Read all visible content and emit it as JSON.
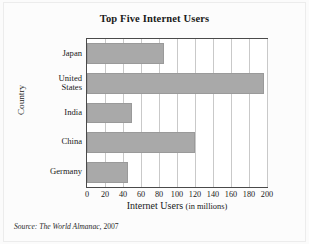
{
  "chart_data": {
    "type": "bar",
    "orientation": "horizontal",
    "title": "Top Five Internet Users",
    "xlabel": "Internet Users",
    "xlabel_units": "(in millions)",
    "ylabel": "Country",
    "categories": [
      "Japan",
      "United States",
      "India",
      "China",
      "Germany"
    ],
    "category_lines": [
      [
        "Japan"
      ],
      [
        "United",
        "States"
      ],
      [
        "India"
      ],
      [
        "China"
      ],
      [
        "Germany"
      ]
    ],
    "values": [
      86,
      197,
      50,
      120,
      46
    ],
    "xlim": [
      0,
      200
    ],
    "xticks": [
      0,
      20,
      40,
      60,
      80,
      100,
      120,
      140,
      160,
      180,
      200
    ],
    "xtick_labels": [
      "0",
      "20",
      "40",
      "60",
      "80",
      "100",
      "120",
      "140",
      "160",
      "180",
      "200"
    ],
    "grid": "vertical",
    "legend": "none",
    "bar_color": "#a9a9a9",
    "plot_background": "#ffffff",
    "gridline_color": "#c9c9c9",
    "axis_color": "#4a4a4a"
  },
  "source": {
    "prefix": "Source:",
    "publication": "The World Almanac",
    "separator": ",",
    "year": "2007",
    "full": "Source: The World Almanac, 2007"
  }
}
